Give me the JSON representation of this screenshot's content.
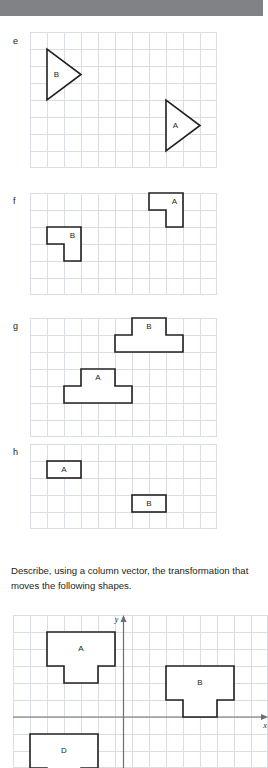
{
  "page": {
    "background_color": "#ffffff",
    "ink_color": "#231f20",
    "grid_line_color": "#d9dde4",
    "axis_color": "#6d6e71",
    "topbar_color": "#808285"
  },
  "prompt": {
    "text": "Describe, using a column vector, the transformation that moves the following shapes."
  },
  "panels": [
    {
      "letter": "e",
      "grid": {
        "cols": 11,
        "rows": 8,
        "cell": 17
      },
      "shapes": [
        {
          "label": "B",
          "type": "triangle",
          "points": "0,0 0,3 2,1.5",
          "origin_col": 1,
          "origin_row": 1,
          "label_col": 0.55,
          "label_row": 1.5
        },
        {
          "label": "A",
          "type": "triangle",
          "points": "0,0 0,3 2,1.5",
          "origin_col": 8,
          "origin_row": 4,
          "label_col": 0.55,
          "label_row": 1.5
        }
      ]
    },
    {
      "letter": "f",
      "grid": {
        "cols": 11,
        "rows": 6,
        "cell": 17
      },
      "shapes": [
        {
          "label": "A",
          "type": "polygon",
          "points": "0,0 2,0 2,2 1,2 1,1 0,1",
          "origin_col": 7,
          "origin_row": 0,
          "label_col": 1.5,
          "label_row": 0.5
        },
        {
          "label": "B",
          "type": "polygon",
          "points": "0,0 2,0 2,2 1,2 1,1 0,1",
          "origin_col": 1,
          "origin_row": 2,
          "label_col": 1.5,
          "label_row": 0.5
        }
      ]
    },
    {
      "letter": "g",
      "grid": {
        "cols": 11,
        "rows": 7,
        "cell": 17
      },
      "shapes": [
        {
          "label": "B",
          "type": "polygon",
          "points": "0,0 2,0 2,1 3,1 3,2 -1,2 -1,1 0,1",
          "origin_col": 6,
          "origin_row": 0,
          "label_col": 1,
          "label_row": 0.5
        },
        {
          "label": "A",
          "type": "polygon",
          "points": "0,0 2,0 2,1 3,1 3,2 -1,2 -1,1 0,1",
          "origin_col": 3,
          "origin_row": 3,
          "label_col": 1,
          "label_row": 0.5
        }
      ]
    },
    {
      "letter": "h",
      "grid": {
        "cols": 11,
        "rows": 5,
        "cell": 17
      },
      "shapes": [
        {
          "label": "A",
          "type": "rect",
          "w": 2,
          "h": 1,
          "origin_col": 1,
          "origin_row": 1,
          "label_col": 1,
          "label_row": 0.5
        },
        {
          "label": "B",
          "type": "rect",
          "w": 2,
          "h": 1,
          "origin_col": 6,
          "origin_row": 3,
          "label_col": 1,
          "label_row": 0.5
        }
      ]
    }
  ],
  "coordinate_grid": {
    "grid": {
      "cols": 15,
      "rows": 9,
      "cell": 17
    },
    "axes": {
      "x_label": "x",
      "y_label": "y",
      "origin_col": 6.5,
      "origin_row": 6
    },
    "shapes": [
      {
        "label": "A",
        "type": "polygon",
        "points": "0,0 4,0 4,2 3,2 3,3 1,3 1,2 0,2",
        "origin_col": 2,
        "origin_row": 1,
        "label_col": 2,
        "label_row": 1
      },
      {
        "label": "B",
        "type": "polygon",
        "points": "0,0 4,0 4,2 3,2 3,3 1,3 1,2 0,2",
        "origin_col": 9,
        "origin_row": 3,
        "label_col": 2,
        "label_row": 1
      },
      {
        "label": "D",
        "type": "polygon",
        "points": "0,0 4,0 4,2 3,2 3,3 1,3 1,2 0,2",
        "origin_col": 1,
        "origin_row": 7,
        "label_col": 2,
        "label_row": 1
      }
    ]
  }
}
